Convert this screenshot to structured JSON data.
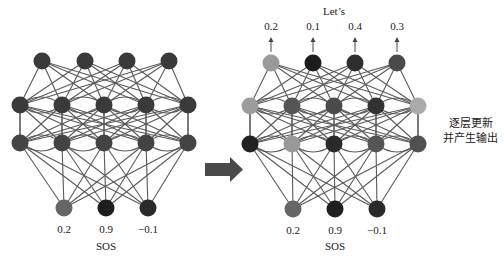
{
  "left_network": {
    "name": "before",
    "layers": {
      "output": {
        "y": 61,
        "nodes": [
          {
            "x": 42,
            "color": "#3a3a3a"
          },
          {
            "x": 85,
            "color": "#3a3a3a"
          },
          {
            "x": 127,
            "color": "#3a3a3a"
          },
          {
            "x": 169,
            "color": "#3a3a3a"
          }
        ]
      },
      "hidden1": {
        "y": 105,
        "nodes": [
          {
            "x": 20,
            "color": "#3a3a3a"
          },
          {
            "x": 62,
            "color": "#3a3a3a"
          },
          {
            "x": 104,
            "color": "#3a3a3a"
          },
          {
            "x": 146,
            "color": "#3a3a3a"
          },
          {
            "x": 188,
            "color": "#3a3a3a"
          }
        ]
      },
      "hidden2": {
        "y": 143,
        "nodes": [
          {
            "x": 20,
            "color": "#444444"
          },
          {
            "x": 62,
            "color": "#444444"
          },
          {
            "x": 104,
            "color": "#444444"
          },
          {
            "x": 146,
            "color": "#444444"
          },
          {
            "x": 188,
            "color": "#444444"
          }
        ]
      },
      "input": {
        "y": 208,
        "nodes": [
          {
            "x": 64,
            "color": "#666666"
          },
          {
            "x": 106,
            "color": "#1e1e1e"
          },
          {
            "x": 148,
            "color": "#2a2a2a"
          }
        ]
      }
    },
    "input_values": [
      "0.2",
      "0.9",
      "−0.1"
    ],
    "input_values_y": 230,
    "input_token": "SOS",
    "input_token_y": 247
  },
  "right_network": {
    "name": "after",
    "layers": {
      "output": {
        "y": 63,
        "nodes": [
          {
            "x": 271,
            "color": "#9a9a9a"
          },
          {
            "x": 313,
            "color": "#1c1c1c"
          },
          {
            "x": 355,
            "color": "#2e2e2e"
          },
          {
            "x": 397,
            "color": "#4a4a4a"
          }
        ]
      },
      "hidden1": {
        "y": 106,
        "nodes": [
          {
            "x": 250,
            "color": "#9c9c9c"
          },
          {
            "x": 292,
            "color": "#555555"
          },
          {
            "x": 334,
            "color": "#4a4a4a"
          },
          {
            "x": 376,
            "color": "#333333"
          },
          {
            "x": 418,
            "color": "#aaaaaa"
          }
        ]
      },
      "hidden2": {
        "y": 144,
        "nodes": [
          {
            "x": 250,
            "color": "#222222"
          },
          {
            "x": 292,
            "color": "#999999"
          },
          {
            "x": 334,
            "color": "#2a2a2a"
          },
          {
            "x": 376,
            "color": "#555555"
          },
          {
            "x": 418,
            "color": "#505050"
          }
        ]
      },
      "input": {
        "y": 209,
        "nodes": [
          {
            "x": 293,
            "color": "#666666"
          },
          {
            "x": 335,
            "color": "#1e1e1e"
          },
          {
            "x": 377,
            "color": "#2a2a2a"
          }
        ]
      }
    },
    "output_values": [
      "0.2",
      "0.1",
      "0.4",
      "0.3"
    ],
    "output_values_y": 27,
    "output_token": "Let’s",
    "output_token_y": 12,
    "input_values": [
      "0.2",
      "0.9",
      "−0.1"
    ],
    "input_values_y": 231,
    "input_token": "SOS",
    "input_token_y": 247
  },
  "transition_arrow": {
    "x": 205,
    "y": 157,
    "width": 38,
    "height": 25,
    "color": "#4a4a4a"
  },
  "side_note": {
    "lines": [
      "逐层更新",
      "并产生输出"
    ]
  },
  "style": {
    "edge_color": "#5a5a5a",
    "node_radius": 8.5
  }
}
